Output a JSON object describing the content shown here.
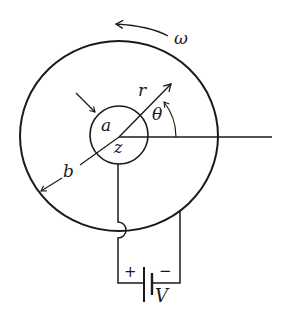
{
  "diagram": {
    "type": "physics-schematic",
    "labels": {
      "omega": "ω",
      "r": "r",
      "theta": "θ",
      "a": "a",
      "z": "z",
      "b": "b",
      "V": "V",
      "plus": "+",
      "minus": "−"
    },
    "components": [
      {
        "name": "outer-cylinder",
        "radius_label": "b"
      },
      {
        "name": "inner-cylinder",
        "radius_label": "a"
      },
      {
        "name": "battery",
        "label": "V",
        "polarity": [
          "+",
          "−"
        ]
      },
      {
        "name": "rotation-arrow",
        "label": "ω",
        "direction": "counterclockwise"
      },
      {
        "name": "radius-vector",
        "label": "r"
      },
      {
        "name": "angle-arc",
        "label": "θ"
      }
    ],
    "colors": {
      "ink": "#1a1a1a",
      "background": "#ffffff"
    }
  }
}
